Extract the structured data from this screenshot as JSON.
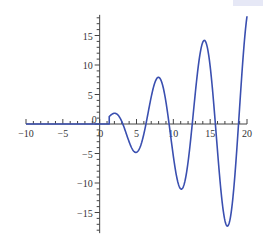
{
  "chart_data": {
    "type": "line",
    "title": "",
    "xlabel": "",
    "ylabel": "",
    "xlim": [
      -10,
      20
    ],
    "ylim": [
      -18.5,
      18.5
    ],
    "grid": false,
    "legend": null,
    "x_ticks": [
      -10,
      -5,
      0,
      5,
      10,
      15,
      20
    ],
    "x_tick_labels": [
      "−10",
      "−5",
      "0",
      "5",
      "10",
      "15",
      "20"
    ],
    "y_ticks": [
      -15,
      -10,
      -5,
      0,
      5,
      10,
      15
    ],
    "y_tick_labels": [
      "−15",
      "−10",
      "−5",
      "0",
      "5",
      "10",
      "15"
    ],
    "series": [
      {
        "name": "f(x)",
        "color": "#3a4fb0",
        "description": "0 for x < ~1.3, then x*sin(x) up to x=20",
        "key_points": [
          {
            "x": -10,
            "y": 0
          },
          {
            "x": 1.3,
            "y": 0
          },
          {
            "x": 2.0,
            "y": 1.8
          },
          {
            "x": 4.9,
            "y": -4.8
          },
          {
            "x": 8.0,
            "y": 7.9
          },
          {
            "x": 11.1,
            "y": -11.0
          },
          {
            "x": 14.2,
            "y": 14.2
          },
          {
            "x": 17.3,
            "y": -17.3
          },
          {
            "x": 20,
            "y": 18.3
          }
        ]
      }
    ]
  }
}
